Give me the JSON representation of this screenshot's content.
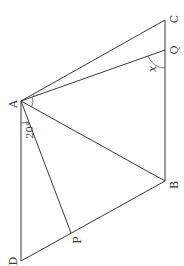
{
  "figure": {
    "type": "geometry",
    "orientation": "rotated 90° clockwise",
    "points": {
      "A": {
        "label": "A",
        "x": 21,
        "y": 101
      },
      "B": {
        "label": "B",
        "x": 165,
        "y": 181
      },
      "C": {
        "label": "C",
        "x": 165,
        "y": 20
      },
      "D": {
        "label": "D",
        "x": 21,
        "y": 261
      },
      "P": {
        "label": "P",
        "x": 71,
        "y": 233
      },
      "Q": {
        "label": "Q",
        "x": 165,
        "y": 50
      }
    },
    "segments": [
      [
        "A",
        "C"
      ],
      [
        "A",
        "Q"
      ],
      [
        "A",
        "B"
      ],
      [
        "A",
        "P"
      ],
      [
        "A",
        "D"
      ],
      [
        "C",
        "Q"
      ],
      [
        "Q",
        "B"
      ],
      [
        "B",
        "P"
      ],
      [
        "P",
        "D"
      ]
    ],
    "angle_labels": {
      "dap": "20°",
      "aqb": "x"
    }
  }
}
